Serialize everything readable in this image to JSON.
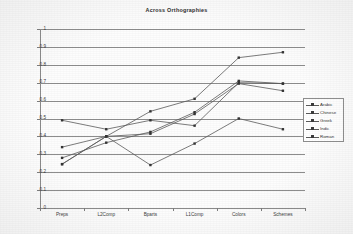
{
  "chart_data": {
    "type": "line",
    "title": "Across Orthographies",
    "xlabel": "",
    "ylabel": "Proportions",
    "ylim": [
      0,
      1
    ],
    "ytick_step": 0.1,
    "yticks": [
      "1",
      "0.9",
      "0.8",
      "0.7",
      "0.6",
      "0.5",
      "0.4",
      "0.3",
      "0.2",
      "0.1",
      "0"
    ],
    "grid": "horizontal",
    "legend_position": "right-outside",
    "categories": [
      "Preps",
      "L2Comp",
      "Bparts",
      "L1Comp",
      "Colors",
      "Schemes"
    ],
    "series": [
      {
        "name": "Arabic",
        "values": [
          0.49,
          0.44,
          0.49,
          0.46,
          0.7,
          0.695
        ]
      },
      {
        "name": "Chinese",
        "values": [
          0.28,
          0.365,
          0.425,
          0.535,
          0.71,
          0.695
        ]
      },
      {
        "name": "Greek",
        "values": [
          0.245,
          0.4,
          0.415,
          0.525,
          0.695,
          0.655
        ]
      },
      {
        "name": "Indic",
        "values": [
          0.34,
          0.4,
          0.54,
          0.61,
          0.84,
          0.87
        ]
      },
      {
        "name": "Roman",
        "values": [
          0.245,
          0.4,
          0.24,
          0.36,
          0.5,
          0.44
        ]
      }
    ],
    "colors": {
      "line": "#5a5a5a",
      "marker": "#343434",
      "grid": "#8d8d8d",
      "axis": "#8a8a8a",
      "text": "#333333",
      "background": "#fdfdfd"
    }
  },
  "legend": {
    "entries": [
      {
        "label": "Arabic"
      },
      {
        "label": "Chinese"
      },
      {
        "label": "Greek"
      },
      {
        "label": "Indic"
      },
      {
        "label": "Roman"
      }
    ]
  }
}
